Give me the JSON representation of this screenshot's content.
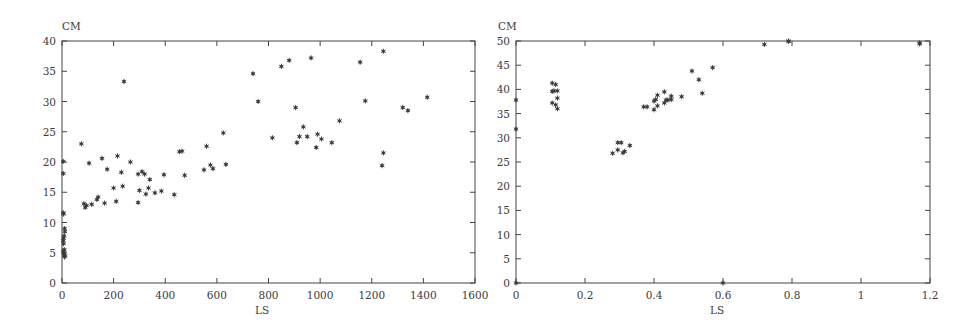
{
  "chart_data": [
    {
      "type": "scatter",
      "title": "",
      "xlabel": "LS",
      "ylabel": "CM",
      "xlim": [
        0,
        1600
      ],
      "ylim": [
        0,
        40
      ],
      "xticks": [
        0,
        200,
        400,
        600,
        800,
        1000,
        1200,
        1400,
        1600
      ],
      "yticks": [
        0,
        5,
        10,
        15,
        20,
        25,
        30,
        35,
        40
      ],
      "grid": false,
      "legend": null,
      "marker": "*",
      "points": [
        [
          5,
          20.1
        ],
        [
          5,
          18.1
        ],
        [
          5,
          11.6
        ],
        [
          6,
          11.4
        ],
        [
          6,
          7.4
        ],
        [
          5,
          7.0
        ],
        [
          6,
          6.5
        ],
        [
          5,
          5.3
        ],
        [
          7,
          5.0
        ],
        [
          8,
          4.6
        ],
        [
          10,
          4.3
        ],
        [
          12,
          4.5
        ],
        [
          10,
          9.0
        ],
        [
          11,
          8.5
        ],
        [
          8,
          7.8
        ],
        [
          9,
          5.5
        ],
        [
          75,
          23.0
        ],
        [
          85,
          13.1
        ],
        [
          90,
          12.5
        ],
        [
          95,
          12.8
        ],
        [
          105,
          19.8
        ],
        [
          115,
          13.0
        ],
        [
          135,
          13.8
        ],
        [
          140,
          14.2
        ],
        [
          155,
          20.6
        ],
        [
          165,
          13.2
        ],
        [
          175,
          18.8
        ],
        [
          200,
          15.7
        ],
        [
          210,
          13.5
        ],
        [
          215,
          21.0
        ],
        [
          230,
          18.3
        ],
        [
          235,
          16.0
        ],
        [
          240,
          33.3
        ],
        [
          265,
          20.0
        ],
        [
          295,
          18.0
        ],
        [
          295,
          13.3
        ],
        [
          300,
          15.3
        ],
        [
          310,
          18.4
        ],
        [
          320,
          18.0
        ],
        [
          325,
          14.7
        ],
        [
          335,
          15.7
        ],
        [
          340,
          17.1
        ],
        [
          360,
          14.9
        ],
        [
          385,
          15.2
        ],
        [
          395,
          17.9
        ],
        [
          435,
          14.6
        ],
        [
          455,
          21.7
        ],
        [
          465,
          21.8
        ],
        [
          475,
          17.8
        ],
        [
          550,
          18.7
        ],
        [
          560,
          22.6
        ],
        [
          575,
          19.5
        ],
        [
          585,
          18.9
        ],
        [
          625,
          24.8
        ],
        [
          635,
          19.6
        ],
        [
          740,
          34.6
        ],
        [
          760,
          30.0
        ],
        [
          815,
          24.0
        ],
        [
          850,
          35.8
        ],
        [
          880,
          36.8
        ],
        [
          905,
          29.0
        ],
        [
          910,
          23.2
        ],
        [
          920,
          24.2
        ],
        [
          935,
          25.8
        ],
        [
          950,
          24.2
        ],
        [
          965,
          37.2
        ],
        [
          985,
          22.4
        ],
        [
          990,
          24.6
        ],
        [
          1005,
          23.8
        ],
        [
          1045,
          23.2
        ],
        [
          1075,
          26.8
        ],
        [
          1155,
          36.5
        ],
        [
          1175,
          30.1
        ],
        [
          1240,
          19.4
        ],
        [
          1245,
          21.5
        ],
        [
          1245,
          38.3
        ],
        [
          1320,
          29.0
        ],
        [
          1340,
          28.5
        ],
        [
          1415,
          30.7
        ]
      ]
    },
    {
      "type": "scatter",
      "title": "",
      "xlabel": "LS",
      "ylabel": "CM",
      "xlim": [
        0,
        1.2
      ],
      "ylim": [
        0,
        50
      ],
      "xticks": [
        0,
        0.2,
        0.4,
        0.6,
        0.8,
        1,
        1.2
      ],
      "yticks": [
        0,
        5,
        10,
        15,
        20,
        25,
        30,
        35,
        40,
        45,
        50
      ],
      "grid": false,
      "legend": null,
      "marker": "*",
      "points": [
        [
          0.0,
          37.8
        ],
        [
          0.0,
          31.8
        ],
        [
          0.0,
          0.0
        ],
        [
          0.105,
          41.3
        ],
        [
          0.115,
          41.0
        ],
        [
          0.105,
          39.6
        ],
        [
          0.11,
          39.7
        ],
        [
          0.12,
          39.7
        ],
        [
          0.105,
          37.2
        ],
        [
          0.115,
          36.8
        ],
        [
          0.12,
          38.2
        ],
        [
          0.12,
          36.0
        ],
        [
          0.28,
          26.8
        ],
        [
          0.295,
          29.0
        ],
        [
          0.305,
          29.0
        ],
        [
          0.295,
          27.5
        ],
        [
          0.31,
          26.9
        ],
        [
          0.315,
          27.2
        ],
        [
          0.33,
          28.4
        ],
        [
          0.37,
          36.4
        ],
        [
          0.38,
          36.4
        ],
        [
          0.4,
          35.8
        ],
        [
          0.4,
          37.6
        ],
        [
          0.405,
          37.9
        ],
        [
          0.41,
          38.8
        ],
        [
          0.41,
          36.6
        ],
        [
          0.43,
          39.5
        ],
        [
          0.43,
          37.2
        ],
        [
          0.435,
          37.8
        ],
        [
          0.44,
          37.8
        ],
        [
          0.45,
          37.9
        ],
        [
          0.45,
          38.6
        ],
        [
          0.48,
          38.5
        ],
        [
          0.51,
          43.8
        ],
        [
          0.53,
          42.0
        ],
        [
          0.54,
          39.2
        ],
        [
          0.57,
          44.5
        ],
        [
          0.6,
          0.0
        ],
        [
          0.72,
          49.3
        ],
        [
          0.79,
          49.9
        ],
        [
          0.79,
          50.0
        ],
        [
          1.17,
          49.6
        ],
        [
          1.17,
          49.4
        ]
      ]
    }
  ],
  "labels": {
    "left": {
      "ylabel": "CM",
      "xlabel": "LS"
    },
    "right": {
      "ylabel": "CM",
      "xlabel": "LS"
    }
  }
}
